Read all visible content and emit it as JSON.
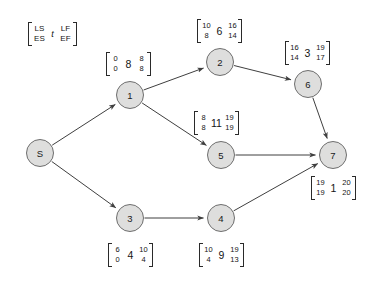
{
  "diagram": {
    "type": "activity-on-node-network",
    "title": "",
    "legend": {
      "ls": "LS",
      "lf": "LF",
      "es": "ES",
      "ef": "EF",
      "duration": "t"
    },
    "node_colors": {
      "fill": "#dededd",
      "stroke": "#6e6e6e",
      "edge": "#3f3f3f",
      "text": "#141414"
    },
    "nodes": [
      {
        "id": "S",
        "label": "S",
        "x": 40,
        "y": 153,
        "has_box": false,
        "ls": "",
        "es": "",
        "t": "",
        "lf": "",
        "ef": "",
        "box_x": 0,
        "box_y": 0
      },
      {
        "id": "1",
        "label": "1",
        "x": 130,
        "y": 95,
        "has_box": true,
        "ls": "0",
        "es": "0",
        "t": "8",
        "lf": "8",
        "ef": "8",
        "box_x": 106,
        "box_y": 52
      },
      {
        "id": "2",
        "label": "2",
        "x": 220,
        "y": 62,
        "has_box": true,
        "ls": "10",
        "es": "8",
        "t": "6",
        "lf": "16",
        "ef": "14",
        "box_x": 197,
        "box_y": 19
      },
      {
        "id": "3",
        "label": "3",
        "x": 130,
        "y": 218,
        "has_box": true,
        "ls": "6",
        "es": "0",
        "t": "4",
        "lf": "10",
        "ef": "4",
        "box_x": 108,
        "box_y": 243
      },
      {
        "id": "4",
        "label": "4",
        "x": 221,
        "y": 218,
        "has_box": true,
        "ls": "10",
        "es": "4",
        "t": "9",
        "lf": "19",
        "ef": "13",
        "box_x": 199,
        "box_y": 243
      },
      {
        "id": "5",
        "label": "5",
        "x": 221,
        "y": 155,
        "has_box": true,
        "ls": "8",
        "es": "8",
        "t": "11",
        "lf": "19",
        "ef": "19",
        "box_x": 194,
        "box_y": 111
      },
      {
        "id": "6",
        "label": "6",
        "x": 308,
        "y": 84,
        "has_box": true,
        "ls": "16",
        "es": "14",
        "t": "3",
        "lf": "19",
        "ef": "17",
        "box_x": 285,
        "box_y": 41
      },
      {
        "id": "7",
        "label": "7",
        "x": 333,
        "y": 155,
        "has_box": true,
        "ls": "19",
        "es": "19",
        "t": "1",
        "lf": "20",
        "ef": "20",
        "box_x": 311,
        "box_y": 176
      }
    ],
    "edges": [
      {
        "from": "S",
        "to": "1"
      },
      {
        "from": "S",
        "to": "3"
      },
      {
        "from": "1",
        "to": "2"
      },
      {
        "from": "1",
        "to": "5"
      },
      {
        "from": "2",
        "to": "6"
      },
      {
        "from": "3",
        "to": "4"
      },
      {
        "from": "4",
        "to": "7"
      },
      {
        "from": "5",
        "to": "7"
      },
      {
        "from": "6",
        "to": "7"
      }
    ]
  }
}
